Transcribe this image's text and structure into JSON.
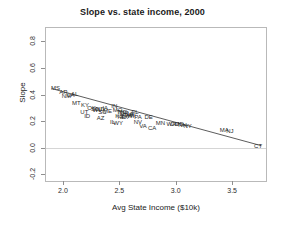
{
  "chart_data": {
    "type": "scatter",
    "title": "Slope vs. state income, 2000",
    "xlabel": "Avg State Income ($10k)",
    "ylabel": "Slope",
    "xlim": [
      1.85,
      3.8
    ],
    "ylim": [
      -0.25,
      0.9
    ],
    "xticks": [
      "2.0",
      "2.5",
      "3.0",
      "3.5"
    ],
    "xtick_values": [
      2.0,
      2.5,
      3.0,
      3.5
    ],
    "yticks": [
      "-0.2",
      "0.0",
      "0.2",
      "0.4",
      "0.6",
      "0.8"
    ],
    "ytick_values": [
      -0.2,
      0.0,
      0.2,
      0.4,
      0.6,
      0.8
    ],
    "grid": false,
    "legend": null,
    "marker_style": "text-label",
    "reference_lines": [
      {
        "name": "zero-line",
        "orientation": "horizontal",
        "y": 0.0,
        "color": "#d5d5d5"
      }
    ],
    "fit_line": {
      "name": "regression-line",
      "color": "#4a4a4a",
      "x_start": 1.9,
      "y_start": 0.445,
      "x_end": 3.76,
      "y_end": 0.015
    },
    "points": [
      {
        "label": "MS",
        "x": 1.935,
        "y": 0.452
      },
      {
        "label": "AR",
        "x": 2.005,
        "y": 0.418
      },
      {
        "label": "NM",
        "x": 2.03,
        "y": 0.388
      },
      {
        "label": "LA",
        "x": 2.07,
        "y": 0.398
      },
      {
        "label": "AL",
        "x": 2.105,
        "y": 0.405
      },
      {
        "label": "MT",
        "x": 2.12,
        "y": 0.338
      },
      {
        "label": "KY",
        "x": 2.195,
        "y": 0.32
      },
      {
        "label": "UT",
        "x": 2.19,
        "y": 0.268
      },
      {
        "label": "ID",
        "x": 2.215,
        "y": 0.24
      },
      {
        "label": "OK",
        "x": 2.255,
        "y": 0.296
      },
      {
        "label": "SD",
        "x": 2.285,
        "y": 0.288
      },
      {
        "label": "WV",
        "x": 2.305,
        "y": 0.286
      },
      {
        "label": "ND",
        "x": 2.33,
        "y": 0.292
      },
      {
        "label": "SC",
        "x": 2.35,
        "y": 0.272
      },
      {
        "label": "IA",
        "x": 2.375,
        "y": 0.3
      },
      {
        "label": "ME",
        "x": 2.395,
        "y": 0.278
      },
      {
        "label": "AZ",
        "x": 2.335,
        "y": 0.222
      },
      {
        "label": "IN",
        "x": 2.455,
        "y": 0.31
      },
      {
        "label": "MO",
        "x": 2.485,
        "y": 0.282
      },
      {
        "label": "TN",
        "x": 2.51,
        "y": 0.272
      },
      {
        "label": "NC",
        "x": 2.53,
        "y": 0.268
      },
      {
        "label": "OR",
        "x": 2.545,
        "y": 0.258
      },
      {
        "label": "KS",
        "x": 2.5,
        "y": 0.236
      },
      {
        "label": "NE",
        "x": 2.52,
        "y": 0.23
      },
      {
        "label": "TX",
        "x": 2.545,
        "y": 0.234
      },
      {
        "label": "OH",
        "x": 2.57,
        "y": 0.248
      },
      {
        "label": "GA",
        "x": 2.585,
        "y": 0.252
      },
      {
        "label": "FL",
        "x": 2.64,
        "y": 0.272
      },
      {
        "label": "MI",
        "x": 2.615,
        "y": 0.244
      },
      {
        "label": "WI",
        "x": 2.6,
        "y": 0.24
      },
      {
        "label": "IL",
        "x": 2.44,
        "y": 0.196
      },
      {
        "label": "WY",
        "x": 2.49,
        "y": 0.184
      },
      {
        "label": "PA",
        "x": 2.665,
        "y": 0.228
      },
      {
        "label": "NV",
        "x": 2.665,
        "y": 0.192
      },
      {
        "label": "VA",
        "x": 2.71,
        "y": 0.166
      },
      {
        "label": "DE",
        "x": 2.76,
        "y": 0.23
      },
      {
        "label": "CA",
        "x": 2.79,
        "y": 0.15
      },
      {
        "label": "MN",
        "x": 2.865,
        "y": 0.188
      },
      {
        "label": "WA",
        "x": 2.96,
        "y": 0.18
      },
      {
        "label": "CO",
        "x": 2.99,
        "y": 0.176
      },
      {
        "label": "MD",
        "x": 3.03,
        "y": 0.176
      },
      {
        "label": "NH",
        "x": 3.06,
        "y": 0.172
      },
      {
        "label": "NY",
        "x": 3.105,
        "y": 0.16
      },
      {
        "label": "MA",
        "x": 3.43,
        "y": 0.132
      },
      {
        "label": "NJ",
        "x": 3.48,
        "y": 0.128
      },
      {
        "label": "CT",
        "x": 3.73,
        "y": 0.012
      }
    ]
  }
}
